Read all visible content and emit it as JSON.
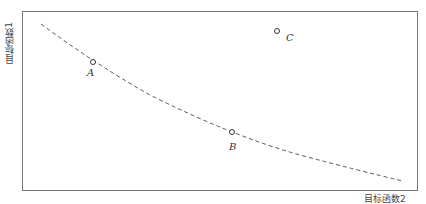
{
  "diagram": {
    "type": "pareto-front-scatter",
    "y_axis_label": "目标函数1",
    "x_axis_label": "目标函数2",
    "curve": {
      "style": "dashed",
      "color": "#555555",
      "description": "Decreasing convex Pareto front"
    },
    "points": [
      {
        "label": "A",
        "on_front": true
      },
      {
        "label": "B",
        "on_front": true
      },
      {
        "label": "C",
        "on_front": false
      }
    ],
    "colors": {
      "frame": "#777777",
      "curve": "#555555",
      "point_stroke": "#333333"
    }
  }
}
